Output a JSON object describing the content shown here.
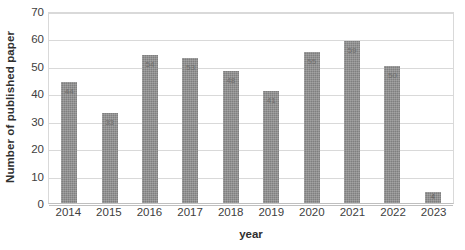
{
  "chart_data": {
    "type": "bar",
    "title": "",
    "xlabel": "year",
    "ylabel": "Number of published paper",
    "categories": [
      "2014",
      "2015",
      "2016",
      "2017",
      "2018",
      "2019",
      "2020",
      "2021",
      "2022",
      "2023"
    ],
    "values": [
      44,
      33,
      54,
      53,
      48,
      41,
      55,
      59,
      50,
      4
    ],
    "value_labels": [
      "44",
      "33",
      "54",
      "53",
      "48",
      "41",
      "55",
      "59",
      "50",
      "4"
    ],
    "ylim": [
      0,
      70
    ],
    "y_ticks": [
      0,
      10,
      20,
      30,
      40,
      50,
      60,
      70
    ],
    "y_tick_labels": [
      "0",
      "10",
      "20",
      "30",
      "40",
      "50",
      "60",
      "70"
    ],
    "grid": "horizontal",
    "legend": "none",
    "bar_color": "#7f7f7f",
    "gridline_color": "#d9d9d9",
    "plot_border_color": "#d9d9d9",
    "text_color": "#404040"
  }
}
